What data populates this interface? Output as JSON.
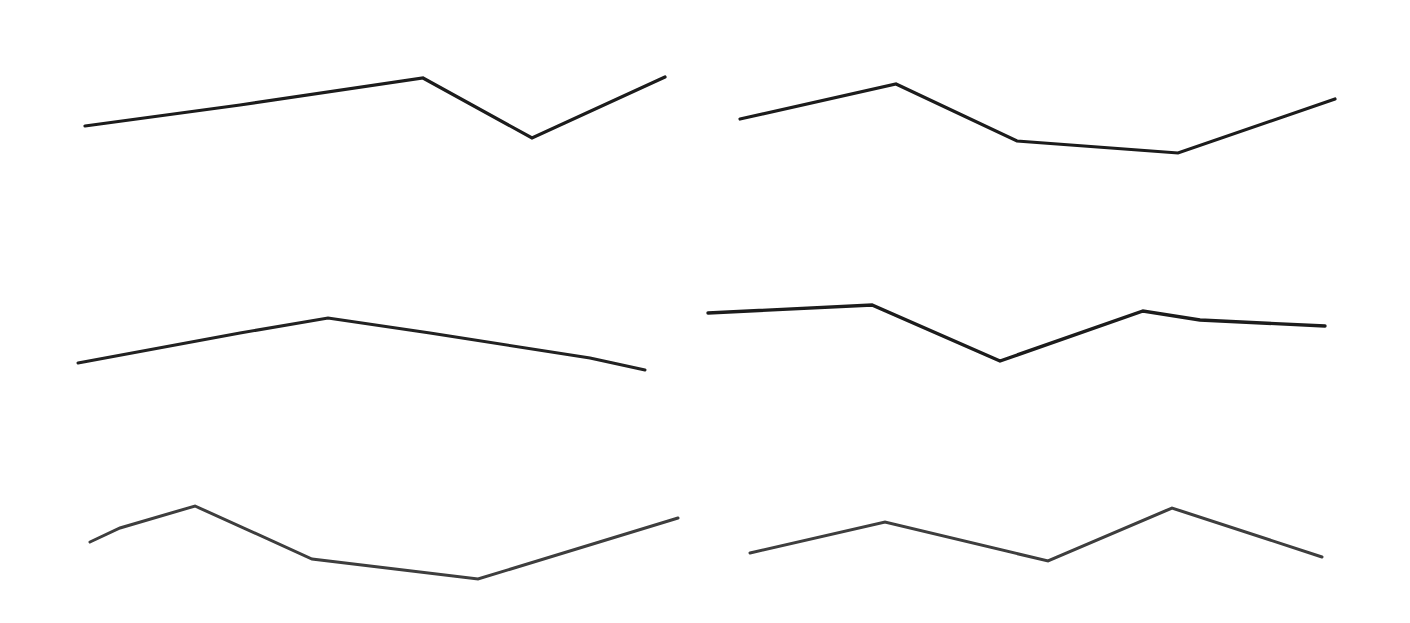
{
  "chart_data": [
    {
      "type": "line",
      "title": "",
      "position": "top-left",
      "stroke": "#1c1c1c",
      "stroke_width": 3.2,
      "points": [
        [
          85,
          126
        ],
        [
          240,
          105
        ],
        [
          423,
          78
        ],
        [
          532,
          138
        ],
        [
          665,
          77
        ]
      ],
      "grid": false,
      "axes": false,
      "legend": null
    },
    {
      "type": "line",
      "title": "",
      "position": "top-right",
      "stroke": "#1c1c1c",
      "stroke_width": 3.2,
      "points": [
        [
          740,
          119
        ],
        [
          896,
          84
        ],
        [
          1017,
          141
        ],
        [
          1178,
          153
        ],
        [
          1335,
          99
        ]
      ],
      "grid": false,
      "axes": false,
      "legend": null
    },
    {
      "type": "line",
      "title": "",
      "position": "middle-left",
      "stroke": "#222222",
      "stroke_width": 3,
      "points": [
        [
          78,
          363
        ],
        [
          240,
          333
        ],
        [
          328,
          318
        ],
        [
          430,
          333
        ],
        [
          590,
          358
        ],
        [
          645,
          370
        ]
      ],
      "grid": false,
      "axes": false,
      "legend": null
    },
    {
      "type": "line",
      "title": "",
      "position": "middle-right",
      "stroke": "#1c1c1c",
      "stroke_width": 3.4,
      "points": [
        [
          708,
          313
        ],
        [
          872,
          305
        ],
        [
          1000,
          361
        ],
        [
          1143,
          311
        ],
        [
          1200,
          320
        ],
        [
          1325,
          326
        ]
      ],
      "grid": false,
      "axes": false,
      "legend": null
    },
    {
      "type": "line",
      "title": "",
      "position": "bottom-left",
      "stroke": "#3e3e3e",
      "stroke_width": 3,
      "points": [
        [
          90,
          542
        ],
        [
          120,
          528
        ],
        [
          195,
          506
        ],
        [
          312,
          559
        ],
        [
          478,
          579
        ],
        [
          678,
          518
        ]
      ],
      "grid": false,
      "axes": false,
      "legend": null
    },
    {
      "type": "line",
      "title": "",
      "position": "bottom-right",
      "stroke": "#3e3e3e",
      "stroke_width": 3,
      "points": [
        [
          750,
          553
        ],
        [
          885,
          522
        ],
        [
          1048,
          561
        ],
        [
          1172,
          508
        ],
        [
          1322,
          557
        ]
      ],
      "grid": false,
      "axes": false,
      "legend": null
    }
  ],
  "canvas": {
    "width": 1410,
    "height": 623,
    "background": "#ffffff"
  }
}
